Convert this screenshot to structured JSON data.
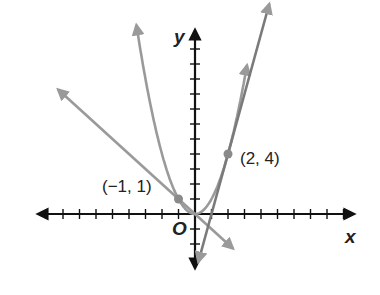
{
  "chart_data": {
    "type": "line",
    "title": "",
    "xlabel": "x",
    "ylabel": "y",
    "origin_label": "O",
    "grid": false,
    "xlim": [
      -10,
      10
    ],
    "ylim": [
      -3,
      12
    ],
    "series": [
      {
        "name": "parabola y = x^2",
        "kind": "curve",
        "color": "#9a9a9a",
        "points": [
          [
            -3.6,
            12.96
          ],
          [
            -2,
            4
          ],
          [
            -1,
            1
          ],
          [
            0,
            0
          ],
          [
            1,
            1
          ],
          [
            2,
            4
          ],
          [
            3.2,
            10.24
          ]
        ]
      },
      {
        "name": "line y = -x",
        "kind": "line",
        "color": "#9a9a9a",
        "points": [
          [
            -8.3,
            8.3
          ],
          [
            2.3,
            -2.3
          ]
        ]
      },
      {
        "name": "line y = 4x - 4 (tangent at (2, 4))",
        "kind": "line",
        "color": "#7a7a7a",
        "points": [
          [
            0.2,
            -3.2
          ],
          [
            4.5,
            14
          ]
        ]
      }
    ],
    "highlighted_points": [
      {
        "label": "(−1, 1)",
        "x": -1,
        "y": 1
      },
      {
        "label": "(2, 4)",
        "x": 2,
        "y": 4
      }
    ],
    "axis_color": "#111111"
  },
  "labels": {
    "y_axis": "y",
    "x_axis": "x",
    "origin": "O",
    "point_a": "(−1, 1)",
    "point_b": "(2, 4)"
  }
}
